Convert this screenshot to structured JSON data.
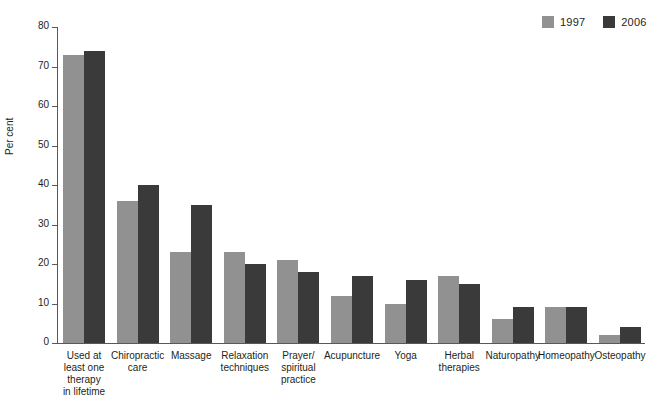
{
  "chart_data": {
    "type": "bar",
    "title": "",
    "xlabel": "",
    "ylabel": "Per cent",
    "ylim": [
      0,
      80
    ],
    "yticks": [
      0,
      10,
      20,
      30,
      40,
      50,
      60,
      70,
      80
    ],
    "grid": false,
    "legend_position": "top-right",
    "categories": [
      "Used at least one therapy in lifetime",
      "Chiropractic care",
      "Massage",
      "Relaxation techniques",
      "Prayer/ spiritual practice",
      "Acupuncture",
      "Yoga",
      "Herbal therapies",
      "Naturopathy",
      "Homeopathy",
      "Osteopathy"
    ],
    "category_lines": [
      [
        "Used at",
        "least one",
        "therapy",
        "in lifetime"
      ],
      [
        "Chiropractic",
        "care"
      ],
      [
        "Massage"
      ],
      [
        "Relaxation",
        "techniques"
      ],
      [
        "Prayer/",
        "spiritual",
        "practice"
      ],
      [
        "Acupuncture"
      ],
      [
        "Yoga"
      ],
      [
        "Herbal",
        "therapies"
      ],
      [
        "Naturopathy"
      ],
      [
        "Homeopathy"
      ],
      [
        "Osteopathy"
      ]
    ],
    "series": [
      {
        "name": "1997",
        "color": "#919191",
        "values": [
          73,
          36,
          23,
          23,
          21,
          12,
          10,
          17,
          6,
          9,
          2
        ]
      },
      {
        "name": "2006",
        "color": "#3a3a3a",
        "values": [
          74,
          40,
          35,
          20,
          18,
          17,
          16,
          15,
          9,
          9,
          4
        ]
      }
    ]
  },
  "legend": {
    "items": [
      {
        "label": "1997",
        "color": "#919191",
        "swatch_name": "legend-swatch-1997"
      },
      {
        "label": "2006",
        "color": "#3a3a3a",
        "swatch_name": "legend-swatch-2006"
      }
    ]
  },
  "axis": {
    "y_title": "Per cent",
    "y_tick_labels": [
      "0",
      "10",
      "20",
      "30",
      "40",
      "50",
      "60",
      "70",
      "80"
    ]
  },
  "colors": {
    "series_1997": "#919191",
    "series_2006": "#3a3a3a",
    "axis": "#58585b",
    "text": "#231f20",
    "background": "#ffffff"
  }
}
